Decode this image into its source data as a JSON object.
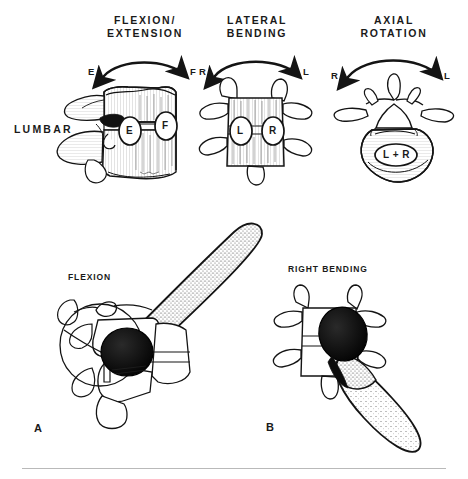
{
  "figure": {
    "row_label": "LUMBAR",
    "divider_color": "#b9b9b9",
    "ink_color": "#141414",
    "paper_color": "#ffffff"
  },
  "top_row": {
    "columns": [
      {
        "heading_line1": "FLEXION/",
        "heading_line2": "EXTENSION",
        "arrow": {
          "left_label": "E",
          "right_label": "F",
          "direction": "bidirectional-arc"
        },
        "view": "lateral",
        "markers": [
          {
            "label": "E",
            "position": "posterior"
          },
          {
            "label": "F",
            "position": "anterior"
          }
        ]
      },
      {
        "heading_line1": "LATERAL",
        "heading_line2": "BENDING",
        "arrow": {
          "left_label": "R",
          "right_label": "L",
          "direction": "bidirectional-arc"
        },
        "view": "anterior",
        "markers": [
          {
            "label": "L",
            "position": "left"
          },
          {
            "label": "R",
            "position": "right"
          }
        ]
      },
      {
        "heading_line1": "AXIAL",
        "heading_line2": "ROTATION",
        "arrow": {
          "left_label": "R",
          "right_label": "L",
          "direction": "bidirectional-arc"
        },
        "view": "superior",
        "markers": [
          {
            "label": "L + R",
            "position": "vertebral-body"
          }
        ]
      }
    ]
  },
  "bottom_row": {
    "panels": [
      {
        "letter": "A",
        "caption": "FLEXION",
        "view": "lateral",
        "contact_shade": "dark",
        "excursion_shade": "stipple"
      },
      {
        "letter": "B",
        "caption": "RIGHT BENDING",
        "view": "posterior",
        "contact_shade": "dark",
        "excursion_shade": "stipple"
      }
    ]
  }
}
